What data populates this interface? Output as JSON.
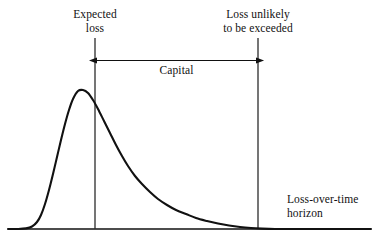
{
  "figure": {
    "background_color": "#ffffff",
    "ink_color": "#111111"
  },
  "annotations": {
    "expected_loss": "Expected\nloss",
    "loss_unlikely": "Loss unlikely\nto be exceeded",
    "capital": "Capital",
    "axis_label": "Loss-over-time\nhorizon"
  },
  "chart_data": {
    "type": "area",
    "title": "",
    "subtitle": "",
    "xlabel": "Loss-over-time horizon",
    "ylabel": "",
    "grid": false,
    "legend_position": "none",
    "axis_line_color": "#111111",
    "curve_color": "#111111",
    "xlim": [
      0,
      373
    ],
    "ylim": [
      0,
      145
    ],
    "baseline_y": 229,
    "axis_start_x": 8,
    "axis_end_x": 371,
    "markers": [
      {
        "name": "expected-loss",
        "label": "Expected loss",
        "x": 95,
        "y_top": 38,
        "y_bottom": 229
      },
      {
        "name": "loss-unlikely-to-be-exceeded",
        "label": "Loss unlikely to be exceeded",
        "x": 258,
        "y_top": 38,
        "y_bottom": 229
      }
    ],
    "span": {
      "name": "capital",
      "label": "Capital",
      "x_start": 96,
      "x_end": 257,
      "y": 60,
      "double_headed": true
    },
    "curve_points": [
      [
        8,
        229
      ],
      [
        18,
        229
      ],
      [
        26,
        228.4
      ],
      [
        32,
        226.5
      ],
      [
        37,
        222
      ],
      [
        41,
        215
      ],
      [
        45,
        204
      ],
      [
        49,
        190
      ],
      [
        53,
        174
      ],
      [
        57,
        157
      ],
      [
        61,
        140
      ],
      [
        65,
        124
      ],
      [
        69,
        110
      ],
      [
        73,
        99
      ],
      [
        78,
        91
      ],
      [
        83,
        90
      ],
      [
        88,
        93
      ],
      [
        93,
        100
      ],
      [
        98,
        109
      ],
      [
        104,
        121
      ],
      [
        110,
        133
      ],
      [
        116,
        145
      ],
      [
        122,
        156
      ],
      [
        128,
        166
      ],
      [
        135,
        176
      ],
      [
        142,
        184
      ],
      [
        150,
        192
      ],
      [
        158,
        199
      ],
      [
        167,
        205
      ],
      [
        176,
        210
      ],
      [
        186,
        214
      ],
      [
        196,
        218
      ],
      [
        207,
        221
      ],
      [
        218,
        223.5
      ],
      [
        229,
        225.5
      ],
      [
        240,
        227
      ],
      [
        251,
        228
      ],
      [
        262,
        228.6
      ],
      [
        275,
        229
      ],
      [
        290,
        229
      ],
      [
        310,
        229
      ],
      [
        340,
        229
      ],
      [
        371,
        229
      ]
    ],
    "peak": {
      "x": 80,
      "y": 90,
      "label": "mode of loss distribution"
    }
  }
}
